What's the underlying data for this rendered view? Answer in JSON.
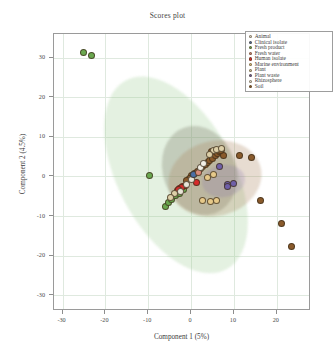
{
  "figure": {
    "title": "Scores plot",
    "background": "#ffffff",
    "frame_color": "#9a9a9a"
  },
  "chart_data": {
    "type": "scatter",
    "title": "Scores plot",
    "xlabel": "Component 1 (5%)",
    "ylabel": "Component 2 (4.5%)",
    "xlim": [
      -32,
      28
    ],
    "ylim": [
      -34,
      36
    ],
    "xticks": [
      -30,
      -20,
      -10,
      0,
      10,
      20
    ],
    "yticks": [
      30,
      20,
      10,
      0,
      -10,
      -20,
      -30
    ],
    "grid": true,
    "grid_color": "#dfe9df",
    "legend_position": "upper right",
    "legend_entries": [
      {
        "name": "Animal",
        "color": "#e8e4d8"
      },
      {
        "name": "Clinical isolate",
        "color": "#4a6fa5"
      },
      {
        "name": "Fresh product",
        "color": "#6aa84f"
      },
      {
        "name": "Fresh water",
        "color": "#d98b7a"
      },
      {
        "name": "Human isolate",
        "color": "#d62b2b"
      },
      {
        "name": "Marine environment",
        "color": "#e6c98a"
      },
      {
        "name": "Plant",
        "color": "#ddcfa8"
      },
      {
        "name": "Plant waste",
        "color": "#6f5fa8"
      },
      {
        "name": "Rhizosphere",
        "color": "#f2efe6"
      },
      {
        "name": "Soil",
        "color": "#8a5a2b"
      }
    ],
    "ellipses": [
      {
        "name": "fresh-product-ellipse",
        "color": "rgba(150,200,140,0.26)",
        "cx": -3.5,
        "cy": 0.5,
        "rx": 13.5,
        "ry": 27.0,
        "angle": -28
      },
      {
        "name": "grey-group-ellipse",
        "color": "rgba(120,118,100,0.30)",
        "cx": 2.0,
        "cy": 1.5,
        "rx": 8.5,
        "ry": 11.5,
        "angle": -20
      },
      {
        "name": "soil-ellipse",
        "color": "rgba(168,128,88,0.28)",
        "cx": 5.5,
        "cy": -0.5,
        "rx": 11.0,
        "ry": 9.5,
        "angle": -14
      },
      {
        "name": "plant-waste-ellipse",
        "color": "rgba(130,110,175,0.22)",
        "cx": 7.5,
        "cy": -1.0,
        "rx": 5.0,
        "ry": 4.0,
        "angle": -10
      }
    ],
    "series": [
      {
        "name": "Fresh product",
        "color": "#6aa84f",
        "points": [
          [
            -25.0,
            31.2
          ],
          [
            -23.2,
            30.6
          ],
          [
            -9.6,
            0.3
          ],
          [
            -6.0,
            -7.6
          ],
          [
            -5.2,
            -6.6
          ],
          [
            -4.6,
            -5.8
          ],
          [
            -3.6,
            -4.9
          ],
          [
            -2.8,
            -4.2
          ],
          [
            -1.8,
            -3.4
          ]
        ]
      },
      {
        "name": "Human isolate",
        "color": "#d62b2b",
        "points": [
          [
            -3.2,
            -3.6
          ],
          [
            -2.6,
            -3.0
          ],
          [
            -2.0,
            -2.6
          ],
          [
            -1.4,
            -2.2
          ],
          [
            1.2,
            -1.4
          ],
          [
            -2.2,
            -2.9
          ],
          [
            -3.0,
            -3.3
          ]
        ]
      },
      {
        "name": "Soil",
        "color": "#8a5a2b",
        "points": [
          [
            0.2,
            0.2
          ],
          [
            0.9,
            0.8
          ],
          [
            1.5,
            1.3
          ],
          [
            2.1,
            1.9
          ],
          [
            2.7,
            2.4
          ],
          [
            3.3,
            2.9
          ],
          [
            3.9,
            3.5
          ],
          [
            4.4,
            4.0
          ],
          [
            5.0,
            4.6
          ],
          [
            5.6,
            5.2
          ],
          [
            6.1,
            5.7
          ],
          [
            6.6,
            6.2
          ],
          [
            7.1,
            6.7
          ],
          [
            7.5,
            5.4
          ],
          [
            11.2,
            5.3
          ],
          [
            14.0,
            4.7
          ],
          [
            16.3,
            -6.2
          ],
          [
            21.2,
            -12.0
          ],
          [
            23.4,
            -17.6
          ],
          [
            -0.4,
            -0.4
          ],
          [
            -1.0,
            -1.0
          ],
          [
            4.8,
            6.4
          ],
          [
            6.9,
            6.5
          ]
        ]
      },
      {
        "name": "Plant",
        "color": "#ddcfa8",
        "points": [
          [
            5.3,
            6.6
          ],
          [
            6.0,
            6.9
          ],
          [
            7.2,
            7.1
          ],
          [
            4.2,
            5.6
          ],
          [
            -3.9,
            -4.4
          ],
          [
            -4.8,
            -5.4
          ]
        ]
      },
      {
        "name": "Marine environment",
        "color": "#e6c98a",
        "points": [
          [
            3.9,
            -0.2
          ],
          [
            2.6,
            -6.2
          ],
          [
            4.6,
            -6.3
          ],
          [
            6.0,
            -6.1
          ],
          [
            5.2,
            0.4
          ]
        ]
      },
      {
        "name": "Plant waste",
        "color": "#6f5fa8",
        "points": [
          [
            8.6,
            -2.0
          ],
          [
            10.0,
            -1.9
          ],
          [
            8.4,
            -2.6
          ],
          [
            6.6,
            2.4
          ]
        ]
      },
      {
        "name": "Animal",
        "color": "#e8e4d8",
        "points": [
          [
            -1.0,
            -2.0
          ],
          [
            0.0,
            -0.8
          ],
          [
            -2.4,
            -3.8
          ]
        ]
      },
      {
        "name": "Clinical isolate",
        "color": "#4a6fa5",
        "points": [
          [
            0.6,
            0.4
          ]
        ]
      },
      {
        "name": "Fresh water",
        "color": "#d98b7a",
        "points": [
          [
            1.8,
            1.0
          ]
        ]
      },
      {
        "name": "Rhizosphere",
        "color": "#f2efe6",
        "points": [
          [
            2.2,
            2.2
          ],
          [
            3.0,
            3.2
          ]
        ]
      }
    ]
  }
}
